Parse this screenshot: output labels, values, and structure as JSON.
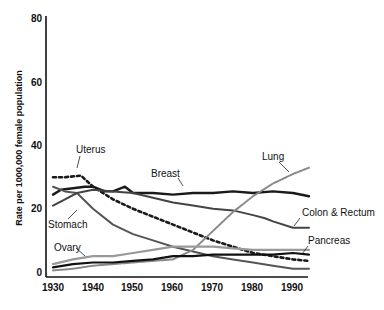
{
  "chart_data": {
    "type": "line",
    "title": "",
    "xlabel": "",
    "ylabel": "Rate per 1000,000 female population",
    "xlim": [
      1930,
      1994
    ],
    "ylim": [
      0,
      80
    ],
    "xticks": [
      1930,
      1940,
      1950,
      1960,
      1970,
      1980,
      1990
    ],
    "yticks": [
      0,
      20,
      40,
      60,
      80
    ],
    "grid": false,
    "legend": "inline labels",
    "series": [
      {
        "name": "Breast",
        "style": "solid-dark",
        "x": [
          1930,
          1932,
          1935,
          1938,
          1940,
          1943,
          1945,
          1948,
          1950,
          1955,
          1960,
          1965,
          1970,
          1975,
          1980,
          1985,
          1990,
          1994
        ],
        "y": [
          24.5,
          26,
          26.5,
          27,
          27,
          25.5,
          25.5,
          27,
          25,
          25,
          24.5,
          25,
          25,
          25.5,
          25,
          25.5,
          25,
          24
        ]
      },
      {
        "name": "Uterus",
        "style": "dotted-heavy",
        "x": [
          1930,
          1933,
          1937,
          1940,
          1945,
          1950,
          1955,
          1960,
          1965,
          1970,
          1975,
          1980,
          1985,
          1990,
          1994
        ],
        "y": [
          30,
          30,
          30.5,
          27,
          23,
          20,
          17.5,
          15,
          12.5,
          10,
          8,
          6,
          5,
          4,
          3.5
        ]
      },
      {
        "name": "Stomach",
        "style": "solid-gray",
        "x": [
          1930,
          1933,
          1936,
          1940,
          1945,
          1950,
          1955,
          1960,
          1965,
          1970,
          1975,
          1980,
          1985,
          1990,
          1994
        ],
        "y": [
          27,
          25.5,
          25,
          20,
          15,
          12,
          10,
          8,
          6.5,
          5,
          4,
          3,
          2,
          1,
          1
        ]
      },
      {
        "name": "Colon & Rectum",
        "style": "solid-dark-gray",
        "x": [
          1930,
          1933,
          1936,
          1940,
          1945,
          1950,
          1955,
          1960,
          1965,
          1970,
          1975,
          1980,
          1983,
          1985,
          1990,
          1994
        ],
        "y": [
          21,
          23,
          25,
          26,
          25.5,
          25,
          23.5,
          22,
          21,
          20,
          19.5,
          18,
          17,
          16,
          14,
          14
        ]
      },
      {
        "name": "Lung",
        "style": "dotted-light",
        "x": [
          1930,
          1935,
          1940,
          1945,
          1950,
          1955,
          1960,
          1965,
          1970,
          1975,
          1980,
          1985,
          1990,
          1994
        ],
        "y": [
          0.5,
          1,
          2,
          2.5,
          3,
          3.5,
          4,
          7,
          13,
          19,
          24,
          28,
          31,
          33
        ]
      },
      {
        "name": "Ovary",
        "style": "solid-light-gray",
        "x": [
          1930,
          1935,
          1940,
          1945,
          1950,
          1955,
          1960,
          1965,
          1970,
          1975,
          1980,
          1985,
          1990,
          1994
        ],
        "y": [
          2.5,
          4,
          5,
          5,
          6,
          7,
          8,
          8,
          8,
          7.5,
          7,
          7,
          7,
          7
        ]
      },
      {
        "name": "Pancreas",
        "style": "solid-black",
        "x": [
          1930,
          1935,
          1940,
          1945,
          1950,
          1955,
          1960,
          1965,
          1970,
          1975,
          1980,
          1985,
          1990,
          1994
        ],
        "y": [
          1.5,
          2.5,
          3,
          3,
          3.5,
          4,
          5,
          5,
          5.5,
          5.5,
          5.5,
          5.5,
          6,
          5.5
        ]
      }
    ],
    "annotations": [
      {
        "text": "Uterus",
        "x_px": 76,
        "y_px": 153
      },
      {
        "text": "Breast",
        "x_px": 152,
        "y_px": 177
      },
      {
        "text": "Lung",
        "x_px": 262,
        "y_px": 160
      },
      {
        "text": "Stomach",
        "x_px": 48,
        "y_px": 228
      },
      {
        "text": "Colon & Rectum",
        "x_px": 303,
        "y_px": 216
      },
      {
        "text": "Ovary",
        "x_px": 54,
        "y_px": 251
      },
      {
        "text": "Pancreas",
        "x_px": 309,
        "y_px": 244
      }
    ]
  },
  "axis": {
    "y_label": "Rate per 1000,000 female population",
    "y_ticks": [
      "80",
      "60",
      "40",
      "20",
      "0"
    ],
    "x_ticks": [
      "1930",
      "1940",
      "1950",
      "1960",
      "1970",
      "1980",
      "1990"
    ]
  },
  "labels": {
    "uterus": "Uterus",
    "breast": "Breast",
    "lung": "Lung",
    "stomach": "Stomach",
    "colon": "Colon & Rectum",
    "ovary": "Ovary",
    "pancreas": "Pancreas"
  },
  "colors": {
    "breast": "#1a1a1a",
    "uterus": "#1a1a1a",
    "stomach": "#555555",
    "colon": "#444444",
    "lung": "#888888",
    "ovary": "#999999",
    "pancreas": "#111111",
    "axis": "#111111"
  }
}
